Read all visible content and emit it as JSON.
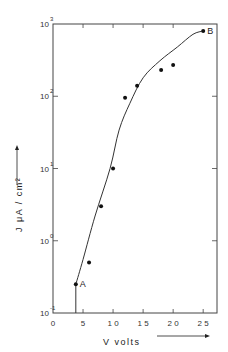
{
  "chart_data": {
    "type": "scatter",
    "title": "",
    "xlabel": "V  volts",
    "ylabel": "J   μA / cm²",
    "xscale": "linear",
    "yscale": "log",
    "xlim": [
      0,
      27.3
    ],
    "ylim": [
      0.1,
      1000
    ],
    "grid": false,
    "x_ticks": [
      0,
      5,
      10,
      15,
      20,
      25
    ],
    "x_tick_labels": [
      "0",
      "5",
      "10",
      "15",
      "20",
      "25"
    ],
    "y_ticks": [
      0.1,
      1,
      10,
      100,
      1000
    ],
    "y_tick_labels": [
      {
        "base": "10",
        "exp": "-1"
      },
      {
        "base": "10",
        "exp": "0"
      },
      {
        "base": "10",
        "exp": "1"
      },
      {
        "base": "10",
        "exp": "2"
      },
      {
        "base": "10",
        "exp": "3"
      }
    ],
    "series": [
      {
        "name": "measured",
        "kind": "points",
        "x": [
          3.8,
          6,
          8,
          10,
          12,
          14,
          18,
          20,
          25
        ],
        "y": [
          0.25,
          0.5,
          3,
          10,
          95,
          140,
          230,
          270,
          800
        ]
      },
      {
        "name": "fit",
        "kind": "line",
        "x": [
          3.8,
          3.8,
          5,
          7,
          9.5,
          11,
          12.8,
          15,
          17.8,
          20.7,
          23.3,
          25
        ],
        "y": [
          0.1,
          0.25,
          0.55,
          2.2,
          10,
          34,
          80,
          180,
          310,
          480,
          720,
          800
        ]
      }
    ],
    "annotations": [
      {
        "text": "A",
        "x": 3.8,
        "y": 0.25
      },
      {
        "text": "B",
        "x": 25,
        "y": 800
      }
    ],
    "arrows": {
      "x_axis_arrow": "right",
      "y_axis_arrow": "up"
    }
  }
}
